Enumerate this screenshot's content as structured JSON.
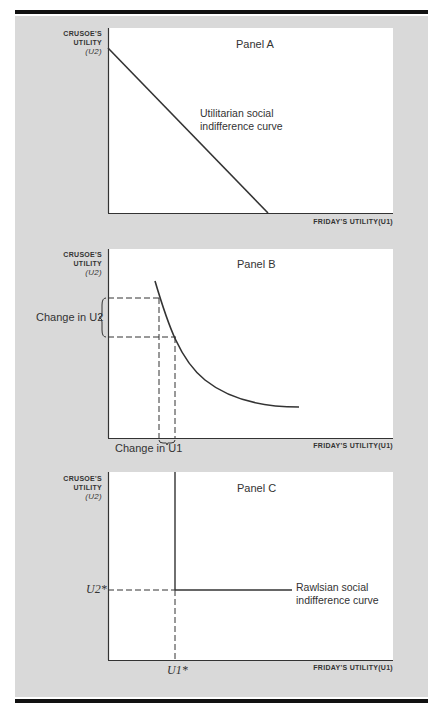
{
  "figure": {
    "panels": [
      {
        "title": "Panel A",
        "y_axis_label": [
          "CRUSOE'S",
          "UTILITY",
          "(U2)"
        ],
        "x_axis_label": "FRIDAY'S UTILITY(U1)",
        "annotation": [
          "Utilitarian social",
          "indifference curve"
        ],
        "curve_type": "straight line, slope -1"
      },
      {
        "title": "Panel B",
        "y_axis_label": [
          "CRUSOE'S",
          "UTILITY",
          "(U2)"
        ],
        "x_axis_label": "FRIDAY'S UTILITY(U1)",
        "y_change_label": "Change in U2",
        "x_change_label": "Change in U1",
        "curve_type": "convex indifference curve"
      },
      {
        "title": "Panel C",
        "y_axis_label": [
          "CRUSOE'S",
          "UTILITY",
          "(U2)"
        ],
        "x_axis_label": "FRIDAY'S UTILITY(U1)",
        "annotation": [
          "Rawlsian social",
          "indifference curve"
        ],
        "x_marker": "U1*",
        "y_marker": "U2*",
        "curve_type": "L-shaped (right angle)"
      }
    ],
    "colors": {
      "background": "#d9d9d9",
      "plot_area": "#ffffff",
      "lines": "#333333",
      "rules": "#111111"
    }
  }
}
